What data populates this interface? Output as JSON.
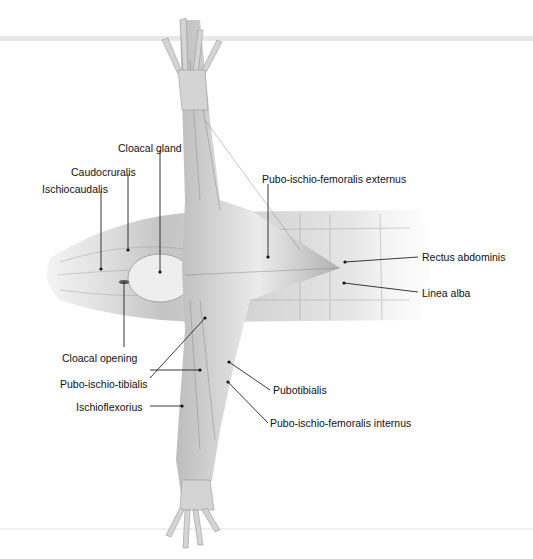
{
  "diagram": {
    "labels": [
      {
        "id": "cloacal-gland",
        "text": "Cloacal gland",
        "x": 118,
        "y": 142,
        "ptx": 160,
        "pty": 272
      },
      {
        "id": "caudocruralis",
        "text": "Caudocruralis",
        "x": 71,
        "y": 166,
        "ptx": 128,
        "pty": 250
      },
      {
        "id": "ischiocaudalis",
        "text": "Ischiocaudalis",
        "x": 42,
        "y": 183,
        "ptx": 101,
        "pty": 269
      },
      {
        "id": "pubo-ischio-femoralis-externus",
        "text": "Pubo-ischio-femoralis externus",
        "x": 262,
        "y": 176,
        "ptx": 268,
        "pty": 257
      },
      {
        "id": "rectus-abdominis",
        "text": "Rectus abdominis",
        "x": 422,
        "y": 251,
        "ptx": 345,
        "pty": 262
      },
      {
        "id": "linea-alba",
        "text": "Linea alba",
        "x": 422,
        "y": 287,
        "ptx": 344,
        "pty": 283
      },
      {
        "id": "cloacal-opening",
        "text": "Cloacal opening",
        "x": 62,
        "y": 352,
        "ptx": 124,
        "pty": 282
      },
      {
        "id": "pubo-ischio-tibialis",
        "text": "Pubo-ischio-tibialis",
        "x": 60,
        "y": 378,
        "ptx": 205,
        "pty": 318
      },
      {
        "id": "ischioflexorius",
        "text": "Ischioflexorius",
        "x": 76,
        "y": 402,
        "ptx": 182,
        "pty": 406
      },
      {
        "id": "pubotibialis",
        "text": "Pubotibialis",
        "x": 272,
        "y": 385,
        "ptx": 229,
        "pty": 362
      },
      {
        "id": "pubo-ischio-femoralis-internus",
        "text": "Pubo-ischio-femoralis internus",
        "x": 270,
        "y": 418,
        "ptx": 228,
        "pty": 382
      }
    ]
  }
}
